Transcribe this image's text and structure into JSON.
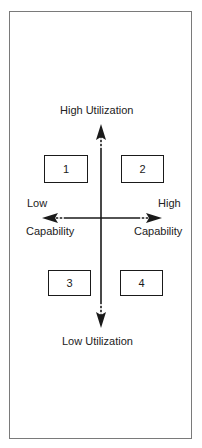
{
  "diagram": {
    "labels": {
      "top": "High Utilization",
      "bottom": "Low Utilization",
      "left_top": "Low",
      "left_bottom": "Capability",
      "right_top": "High",
      "right_bottom": "Capability"
    },
    "quadrants": [
      {
        "id": "1"
      },
      {
        "id": "2"
      },
      {
        "id": "3"
      },
      {
        "id": "4"
      }
    ],
    "axes": {
      "vertical": {
        "from": "Low Utilization",
        "to": "High Utilization",
        "arrowheads": "both"
      },
      "horizontal": {
        "from": "Low Capability",
        "to": "High Capability",
        "arrowheads": "both",
        "style": "dashed-end"
      }
    },
    "colors": {
      "line": "#1a1a1a",
      "frame": "#7a7a7a",
      "background": "#ffffff"
    }
  }
}
